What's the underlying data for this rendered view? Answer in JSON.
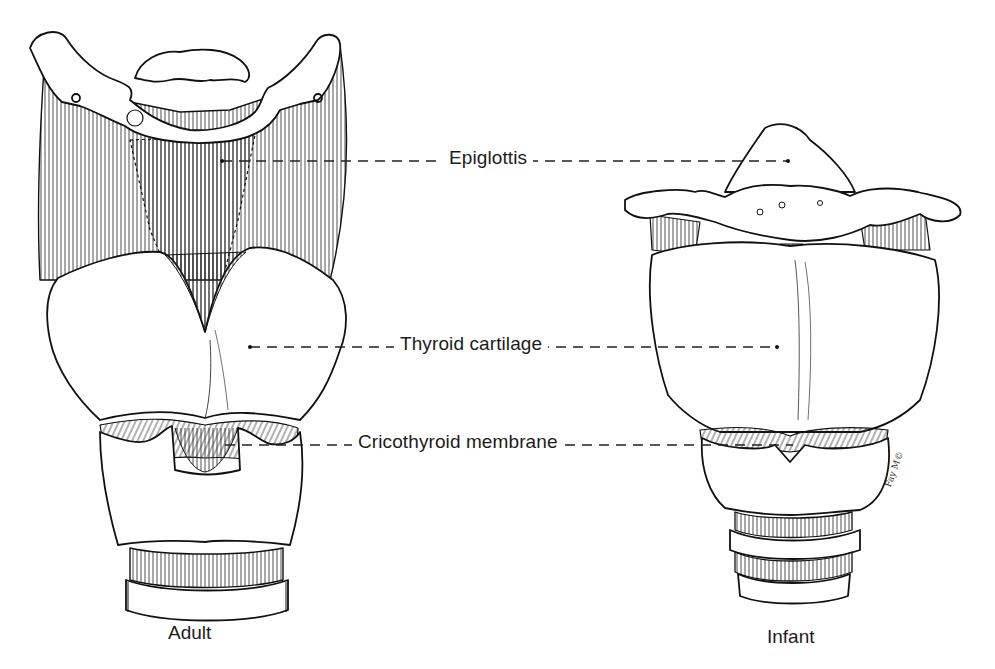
{
  "figure": {
    "panels": [
      {
        "id": "adult",
        "caption": "Adult"
      },
      {
        "id": "infant",
        "caption": "Infant"
      }
    ],
    "labels": [
      {
        "id": "epiglottis",
        "text": "Epiglottis",
        "leader": {
          "x1": 222,
          "x2": 788,
          "y": 161
        }
      },
      {
        "id": "thyroid",
        "text": "Thyroid cartilage",
        "leader": {
          "x1": 250,
          "x2": 777,
          "y": 347
        }
      },
      {
        "id": "cricothyroid",
        "text": "Cricothyroid membrane",
        "leader": {
          "x1": 225,
          "x2": 793,
          "y": 445
        }
      }
    ],
    "signature": "Fay M©",
    "colors": {
      "ink": "#1a1a1a",
      "background": "#ffffff"
    }
  }
}
